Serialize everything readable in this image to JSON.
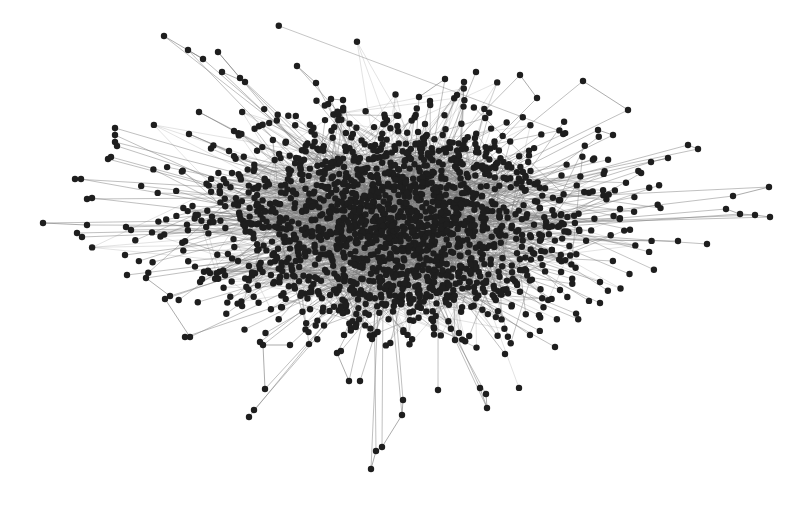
{
  "figure": {
    "type": "network-graph",
    "layout": "force-directed",
    "width": 808,
    "height": 506,
    "background": "#ffffff",
    "node_color": "#1e1e1e",
    "edge_color": "#7a7a7a",
    "node_radius": 3.2,
    "core": {
      "cx": 395,
      "cy": 225,
      "rx": 150,
      "ry": 95,
      "node_count": 1400,
      "edge_count": 1800
    },
    "halo": {
      "cx": 400,
      "cy": 225,
      "rx": 260,
      "ry": 125,
      "node_count": 420
    },
    "seed": 12345
  },
  "outliers": [
    [
      164,
      36
    ],
    [
      188,
      50
    ],
    [
      203,
      59
    ],
    [
      218,
      52
    ],
    [
      222,
      72
    ],
    [
      240,
      78
    ],
    [
      245,
      82
    ],
    [
      297,
      66
    ],
    [
      316,
      83
    ],
    [
      331,
      99
    ],
    [
      343,
      100
    ],
    [
      199,
      112
    ],
    [
      234,
      131
    ],
    [
      189,
      134
    ],
    [
      229,
      151
    ],
    [
      115,
      128
    ],
    [
      115,
      135
    ],
    [
      115,
      142
    ],
    [
      117,
      146
    ],
    [
      108,
      159
    ],
    [
      111,
      157
    ],
    [
      75,
      179
    ],
    [
      81,
      179
    ],
    [
      87,
      199
    ],
    [
      92,
      198
    ],
    [
      43,
      223
    ],
    [
      87,
      225
    ],
    [
      77,
      233
    ],
    [
      82,
      237
    ],
    [
      126,
      227
    ],
    [
      131,
      230
    ],
    [
      445,
      79
    ],
    [
      419,
      97
    ],
    [
      430,
      101
    ],
    [
      457,
      95
    ],
    [
      464,
      82
    ],
    [
      476,
      72
    ],
    [
      520,
      75
    ],
    [
      537,
      98
    ],
    [
      583,
      81
    ],
    [
      628,
      110
    ],
    [
      598,
      130
    ],
    [
      613,
      135
    ],
    [
      688,
      145
    ],
    [
      698,
      149
    ],
    [
      668,
      158
    ],
    [
      651,
      162
    ],
    [
      733,
      196
    ],
    [
      769,
      187
    ],
    [
      726,
      209
    ],
    [
      740,
      214
    ],
    [
      755,
      215
    ],
    [
      770,
      217
    ],
    [
      707,
      244
    ],
    [
      678,
      241
    ],
    [
      125,
      255
    ],
    [
      127,
      275
    ],
    [
      146,
      278
    ],
    [
      170,
      296
    ],
    [
      165,
      299
    ],
    [
      190,
      337
    ],
    [
      185,
      337
    ],
    [
      260,
      342
    ],
    [
      249,
      417
    ],
    [
      254,
      410
    ],
    [
      265,
      389
    ],
    [
      263,
      345
    ],
    [
      290,
      345
    ],
    [
      337,
      353
    ],
    [
      349,
      381
    ],
    [
      360,
      381
    ],
    [
      371,
      469
    ],
    [
      376,
      451
    ],
    [
      382,
      447
    ],
    [
      402,
      415
    ],
    [
      403,
      400
    ],
    [
      372,
      339
    ],
    [
      438,
      390
    ],
    [
      486,
      394
    ],
    [
      487,
      408
    ],
    [
      480,
      388
    ],
    [
      455,
      340
    ],
    [
      555,
      347
    ],
    [
      505,
      354
    ],
    [
      530,
      335
    ],
    [
      600,
      303
    ],
    [
      600,
      282
    ],
    [
      560,
      290
    ]
  ],
  "outlier_links": [
    [
      0,
      2
    ],
    [
      1,
      2
    ],
    [
      3,
      5
    ],
    [
      4,
      6
    ],
    [
      7,
      8
    ],
    [
      9,
      10
    ],
    [
      11,
      12
    ],
    [
      13,
      14
    ],
    [
      15,
      16
    ],
    [
      16,
      17
    ],
    [
      17,
      18
    ],
    [
      21,
      22
    ],
    [
      23,
      24
    ],
    [
      25,
      26
    ],
    [
      27,
      28
    ],
    [
      31,
      32
    ],
    [
      34,
      35
    ],
    [
      37,
      38
    ],
    [
      39,
      40
    ],
    [
      41,
      42
    ],
    [
      43,
      44
    ],
    [
      45,
      46
    ],
    [
      47,
      48
    ],
    [
      49,
      50
    ],
    [
      50,
      51
    ],
    [
      51,
      52
    ],
    [
      57,
      58
    ],
    [
      59,
      60
    ],
    [
      65,
      66
    ],
    [
      66,
      67
    ],
    [
      68,
      69
    ],
    [
      71,
      72
    ],
    [
      72,
      73
    ],
    [
      73,
      74
    ],
    [
      74,
      75
    ],
    [
      78,
      79
    ],
    [
      79,
      80
    ]
  ]
}
